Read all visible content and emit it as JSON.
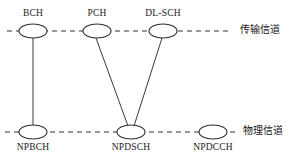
{
  "diagram": {
    "colors": {
      "stroke": "#333333",
      "text": "#1a1a1a",
      "background": "#ffffff"
    },
    "layers": [
      {
        "id": "transport",
        "label": "传输信道",
        "label_x": 240,
        "label_y": 24,
        "line_y": 31,
        "line_x1": 7,
        "line_x2": 231
      },
      {
        "id": "physical",
        "label": "物理信道",
        "label_x": 243,
        "label_y": 125,
        "line_y": 132,
        "line_x1": 5,
        "line_x2": 238
      }
    ],
    "nodes": [
      {
        "id": "bch",
        "label": "BCH",
        "layer": "transport",
        "cx": 33,
        "cy": 31,
        "rx": 14,
        "ry": 7,
        "label_x": 33,
        "label_y": 8
      },
      {
        "id": "pch",
        "label": "PCH",
        "layer": "transport",
        "cx": 97,
        "cy": 31,
        "rx": 14,
        "ry": 7,
        "label_x": 97,
        "label_y": 8
      },
      {
        "id": "dl-sch",
        "label": "DL-SCH",
        "layer": "transport",
        "cx": 163,
        "cy": 31,
        "rx": 14,
        "ry": 7,
        "label_x": 163,
        "label_y": 8
      },
      {
        "id": "npbch",
        "label": "NPBCH",
        "layer": "physical",
        "cx": 33,
        "cy": 132,
        "rx": 14,
        "ry": 7,
        "label_x": 33,
        "label_y": 142
      },
      {
        "id": "npdsch",
        "label": "NPDSCH",
        "layer": "physical",
        "cx": 131,
        "cy": 132,
        "rx": 14,
        "ry": 7,
        "label_x": 131,
        "label_y": 142
      },
      {
        "id": "npdcch",
        "label": "NPDCCH",
        "layer": "physical",
        "cx": 213,
        "cy": 132,
        "rx": 14,
        "ry": 7,
        "label_x": 213,
        "label_y": 142
      }
    ],
    "connections": [
      {
        "id": "bch-npbch",
        "from": "bch",
        "to": "npbch",
        "x1": 33,
        "y1": 38,
        "x2": 33,
        "y2": 125
      },
      {
        "id": "pch-npdsch",
        "from": "pch",
        "to": "npdsch",
        "x1": 96,
        "y1": 38,
        "x2": 128,
        "y2": 126
      },
      {
        "id": "dlsch-npdsch",
        "from": "dl-sch",
        "to": "npdsch",
        "x1": 162,
        "y1": 38,
        "x2": 134,
        "y2": 126
      }
    ]
  }
}
